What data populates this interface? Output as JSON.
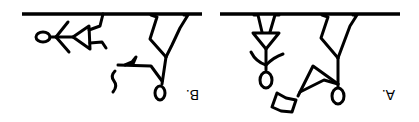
{
  "figure": {
    "orientation": "rotated-180",
    "panels": [
      {
        "id": "B",
        "label": "B.",
        "description": "Upside-down panel: a stick figure lying horizontally beneath a bar, and a second stick figure hanging from the bar by both legs holding a small object with a wavy tail"
      },
      {
        "id": "A",
        "label": "A.",
        "description": "Upside-down panel: a stick figure with triangular dress hanging from a bar, and a second stick figure hanging by its legs reaching toward a box-like object"
      }
    ]
  }
}
